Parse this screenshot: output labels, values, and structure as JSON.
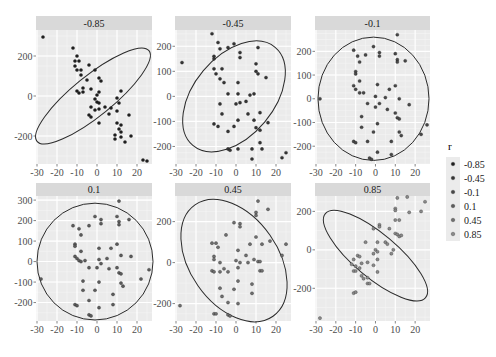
{
  "chart_data": {
    "type": "scatter",
    "title": "",
    "xlabel": "",
    "ylabel": "",
    "facet_by": "r",
    "legend": {
      "title": "r",
      "position": "right",
      "entries": [
        "-0.85",
        "-0.45",
        "-0.1",
        "0.1",
        "0.45",
        "0.85"
      ],
      "colors": [
        "#1f1f1f",
        "#353535",
        "#484848",
        "#5c5c5c",
        "#6f6f6f",
        "#8a8a8a"
      ]
    },
    "x_ticks": [
      -30,
      -20,
      -10,
      0,
      10,
      20
    ],
    "xlim": [
      -30,
      27
    ],
    "grid": true,
    "panels": [
      {
        "label": "-0.85",
        "y_ticks": [
          200,
          0,
          -200
        ],
        "ylim": [
          -340,
          330
        ],
        "ellipse": {
          "cx": -2,
          "cy": 0,
          "rx_deg": -39,
          "a": 36,
          "b": 10
        },
        "points": [
          [
            -27,
            295
          ],
          [
            -12,
            240
          ],
          [
            -10,
            200
          ],
          [
            -11,
            175
          ],
          [
            -9,
            175
          ],
          [
            -11,
            150
          ],
          [
            -8,
            130
          ],
          [
            -10,
            130
          ],
          [
            -4,
            155
          ],
          [
            -1,
            130
          ],
          [
            -8,
            105
          ],
          [
            -7,
            40
          ],
          [
            -5,
            80
          ],
          [
            -3,
            35
          ],
          [
            -10,
            25
          ],
          [
            -9,
            15
          ],
          [
            -7,
            20
          ],
          [
            1,
            90
          ],
          [
            2,
            75
          ],
          [
            1,
            20
          ],
          [
            0,
            5
          ],
          [
            -1,
            -15
          ],
          [
            0,
            -30
          ],
          [
            1,
            -35
          ],
          [
            -3,
            -55
          ],
          [
            -1,
            -70
          ],
          [
            1,
            -65
          ],
          [
            4,
            -55
          ],
          [
            6,
            -90
          ],
          [
            7,
            -60
          ],
          [
            -4,
            -95
          ],
          [
            -3,
            -105
          ],
          [
            1,
            -135
          ],
          [
            10,
            -10
          ],
          [
            11,
            -35
          ],
          [
            12,
            25
          ],
          [
            10,
            -75
          ],
          [
            10,
            -135
          ],
          [
            12,
            -145
          ],
          [
            11,
            -165
          ],
          [
            12,
            -180
          ],
          [
            9,
            -195
          ],
          [
            14,
            -230
          ],
          [
            12,
            -205
          ],
          [
            9,
            -215
          ],
          [
            16,
            -95
          ],
          [
            17,
            -200
          ],
          [
            23,
            -320
          ],
          [
            25,
            -325
          ]
        ]
      },
      {
        "label": "-0.45",
        "y_ticks": [
          200,
          100,
          0,
          -100,
          -200
        ],
        "ylim": [
          -270,
          265
        ],
        "ellipse": {
          "cx": -1,
          "cy": 0,
          "rx_deg": -50,
          "a": 32,
          "b": 20
        },
        "points": [
          [
            -12,
            250
          ],
          [
            -9,
            215
          ],
          [
            -1,
            210
          ],
          [
            -4,
            195
          ],
          [
            -8,
            190
          ],
          [
            11,
            195
          ],
          [
            2,
            175
          ],
          [
            2,
            155
          ],
          [
            -11,
            160
          ],
          [
            -11,
            150
          ],
          [
            -27,
            135
          ],
          [
            -11,
            110
          ],
          [
            -10,
            90
          ],
          [
            -7,
            110
          ],
          [
            10,
            130
          ],
          [
            10,
            100
          ],
          [
            11,
            90
          ],
          [
            15,
            75
          ],
          [
            -8,
            70
          ],
          [
            -6,
            55
          ],
          [
            1,
            55
          ],
          [
            -4,
            10
          ],
          [
            1,
            10
          ],
          [
            7,
            5
          ],
          [
            9,
            10
          ],
          [
            -8,
            -30
          ],
          [
            0,
            -30
          ],
          [
            2,
            -25
          ],
          [
            5,
            -20
          ],
          [
            -7,
            -70
          ],
          [
            6,
            -70
          ],
          [
            12,
            -65
          ],
          [
            -11,
            -110
          ],
          [
            -9,
            -120
          ],
          [
            -1,
            -120
          ],
          [
            1,
            -95
          ],
          [
            9,
            -95
          ],
          [
            10,
            -125
          ],
          [
            12,
            -135
          ],
          [
            16,
            -105
          ],
          [
            -4,
            -140
          ],
          [
            12,
            -185
          ],
          [
            13,
            -210
          ],
          [
            -4,
            -210
          ],
          [
            -3,
            -215
          ],
          [
            1,
            -210
          ],
          [
            8,
            -210
          ],
          [
            8,
            -250
          ],
          [
            23,
            -245
          ],
          [
            25,
            -225
          ]
        ]
      },
      {
        "label": "-0.1",
        "y_ticks": [
          200,
          100,
          0,
          -100,
          -200
        ],
        "ylim": [
          -275,
          290
        ],
        "ellipse": {
          "cx": -1,
          "cy": 0,
          "rx_deg": 0,
          "a": 28,
          "b": 260
        },
        "points": [
          [
            11,
            270
          ],
          [
            -11,
            205
          ],
          [
            -1,
            220
          ],
          [
            2,
            195
          ],
          [
            2,
            180
          ],
          [
            -9,
            180
          ],
          [
            -5,
            185
          ],
          [
            10,
            190
          ],
          [
            11,
            165
          ],
          [
            11,
            155
          ],
          [
            15,
            160
          ],
          [
            -8,
            155
          ],
          [
            -10,
            115
          ],
          [
            -10,
            105
          ],
          [
            -8,
            75
          ],
          [
            -11,
            55
          ],
          [
            -10,
            40
          ],
          [
            1,
            60
          ],
          [
            10,
            55
          ],
          [
            -8,
            25
          ],
          [
            -6,
            25
          ],
          [
            7,
            40
          ],
          [
            0,
            10
          ],
          [
            5,
            5
          ],
          [
            12,
            0
          ],
          [
            -4,
            -20
          ],
          [
            2,
            -20
          ],
          [
            0,
            -35
          ],
          [
            17,
            -25
          ],
          [
            6,
            -45
          ],
          [
            10,
            -60
          ],
          [
            -7,
            -75
          ],
          [
            11,
            -80
          ],
          [
            12,
            -85
          ],
          [
            -7,
            -120
          ],
          [
            1,
            -105
          ],
          [
            -1,
            -140
          ],
          [
            12,
            -140
          ],
          [
            13,
            -155
          ],
          [
            26,
            -110
          ],
          [
            23,
            -150
          ],
          [
            -28,
            0
          ],
          [
            -11,
            -180
          ],
          [
            -10,
            -185
          ],
          [
            -4,
            -180
          ],
          [
            8,
            -180
          ],
          [
            1,
            -225
          ],
          [
            8,
            -235
          ],
          [
            -3,
            -250
          ],
          [
            -2,
            -255
          ]
        ]
      },
      {
        "label": "0.1",
        "y_ticks": [
          300,
          200,
          100,
          0,
          -100,
          -200
        ],
        "ylim": [
          -290,
          320
        ],
        "ellipse": {
          "cx": -1,
          "cy": 0,
          "rx_deg": 0,
          "a": 29,
          "b": 285
        },
        "points": [
          [
            11,
            295
          ],
          [
            -1,
            220
          ],
          [
            2,
            205
          ],
          [
            2,
            185
          ],
          [
            10,
            220
          ],
          [
            11,
            195
          ],
          [
            11,
            180
          ],
          [
            16,
            205
          ],
          [
            -12,
            175
          ],
          [
            -9,
            160
          ],
          [
            -4,
            175
          ],
          [
            -8,
            130
          ],
          [
            -11,
            85
          ],
          [
            -11,
            75
          ],
          [
            -8,
            50
          ],
          [
            1,
            65
          ],
          [
            7,
            65
          ],
          [
            10,
            85
          ],
          [
            -11,
            25
          ],
          [
            -10,
            15
          ],
          [
            -9,
            5
          ],
          [
            -8,
            0
          ],
          [
            -6,
            5
          ],
          [
            1,
            10
          ],
          [
            5,
            15
          ],
          [
            12,
            30
          ],
          [
            17,
            25
          ],
          [
            2,
            -10
          ],
          [
            0,
            -30
          ],
          [
            -4,
            -30
          ],
          [
            6,
            -35
          ],
          [
            10,
            -30
          ],
          [
            11,
            -55
          ],
          [
            12,
            -60
          ],
          [
            26,
            -40
          ],
          [
            -28,
            -85
          ],
          [
            -7,
            -95
          ],
          [
            1,
            -100
          ],
          [
            22,
            -85
          ],
          [
            12,
            -105
          ],
          [
            13,
            -120
          ],
          [
            -7,
            -140
          ],
          [
            -1,
            -140
          ],
          [
            8,
            -160
          ],
          [
            -4,
            -190
          ],
          [
            -11,
            -210
          ],
          [
            -10,
            -215
          ],
          [
            1,
            -225
          ],
          [
            8,
            -210
          ],
          [
            -4,
            -260
          ],
          [
            -3,
            -265
          ]
        ]
      },
      {
        "label": "0.45",
        "y_ticks": [
          200,
          0,
          -200
        ],
        "ylim": [
          -285,
          325
        ],
        "ellipse": {
          "cx": -1,
          "cy": 10,
          "rx_deg": 55,
          "a": 34,
          "b": 22
        },
        "points": [
          [
            11,
            300
          ],
          [
            16,
            260
          ],
          [
            10,
            245
          ],
          [
            10,
            230
          ],
          [
            -1,
            195
          ],
          [
            2,
            190
          ],
          [
            2,
            175
          ],
          [
            -5,
            135
          ],
          [
            10,
            125
          ],
          [
            -12,
            95
          ],
          [
            -10,
            95
          ],
          [
            -9,
            75
          ],
          [
            7,
            90
          ],
          [
            13,
            90
          ],
          [
            17,
            105
          ],
          [
            25,
            90
          ],
          [
            1,
            60
          ],
          [
            -11,
            30
          ],
          [
            -11,
            15
          ],
          [
            5,
            35
          ],
          [
            23,
            35
          ],
          [
            -8,
            0
          ],
          [
            0,
            10
          ],
          [
            2,
            0
          ],
          [
            6,
            0
          ],
          [
            9,
            15
          ],
          [
            11,
            5
          ],
          [
            12,
            5
          ],
          [
            1,
            -25
          ],
          [
            -6,
            -30
          ],
          [
            -4,
            -45
          ],
          [
            -12,
            -40
          ],
          [
            -11,
            -45
          ],
          [
            -8,
            -45
          ],
          [
            12,
            -40
          ],
          [
            13,
            -40
          ],
          [
            1,
            -90
          ],
          [
            8,
            -105
          ],
          [
            -8,
            -125
          ],
          [
            -1,
            -130
          ],
          [
            8,
            -150
          ],
          [
            -7,
            -165
          ],
          [
            -4,
            -195
          ],
          [
            1,
            -200
          ],
          [
            -11,
            -250
          ],
          [
            -10,
            -250
          ],
          [
            -4,
            -255
          ],
          [
            -3,
            -260
          ],
          [
            -28,
            -210
          ]
        ]
      },
      {
        "label": "0.85",
        "y_ticks": [
          200,
          0,
          -200
        ],
        "ylim": [
          -370,
          280
        ],
        "ellipse": {
          "cx": 0,
          "cy": -30,
          "rx_deg": 40,
          "a": 33,
          "b": 11
        },
        "points": [
          [
            11,
            270
          ],
          [
            16,
            275
          ],
          [
            25,
            250
          ],
          [
            10,
            215
          ],
          [
            10,
            205
          ],
          [
            17,
            195
          ],
          [
            23,
            200
          ],
          [
            10,
            155
          ],
          [
            12,
            155
          ],
          [
            2,
            130
          ],
          [
            2,
            120
          ],
          [
            -1,
            110
          ],
          [
            7,
            110
          ],
          [
            10,
            85
          ],
          [
            11,
            80
          ],
          [
            12,
            70
          ],
          [
            13,
            75
          ],
          [
            -5,
            40
          ],
          [
            5,
            40
          ],
          [
            6,
            30
          ],
          [
            1,
            40
          ],
          [
            9,
            0
          ],
          [
            0,
            0
          ],
          [
            1,
            -10
          ],
          [
            -1,
            -20
          ],
          [
            8,
            -20
          ],
          [
            -9,
            -30
          ],
          [
            -8,
            -35
          ],
          [
            -11,
            -50
          ],
          [
            -12,
            -75
          ],
          [
            -10,
            -85
          ],
          [
            -7,
            -70
          ],
          [
            -4,
            -65
          ],
          [
            1,
            -50
          ],
          [
            -8,
            -95
          ],
          [
            -11,
            -110
          ],
          [
            -10,
            -110
          ],
          [
            -1,
            -80
          ],
          [
            1,
            -115
          ],
          [
            -7,
            -135
          ],
          [
            -6,
            -150
          ],
          [
            -4,
            -145
          ],
          [
            -4,
            -175
          ],
          [
            -3,
            -175
          ],
          [
            -11,
            -225
          ],
          [
            -10,
            -220
          ],
          [
            -28,
            -355
          ]
        ]
      }
    ]
  }
}
